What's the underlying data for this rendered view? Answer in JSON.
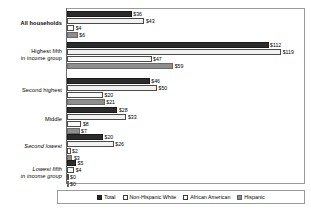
{
  "chart_data": {
    "type": "bar",
    "orientation": "horizontal",
    "title": "",
    "xlabel": "",
    "ylabel": "",
    "grid": false,
    "legend_position": "bottom",
    "xlim": [
      0,
      125
    ],
    "value_prefix": "$",
    "categories": [
      "All households",
      "Highest fifth in income group",
      "Second highest",
      "Middle",
      "Second lowest",
      "Lowest fifth in income group"
    ],
    "series": [
      {
        "name": "Total",
        "color": "#2b2b2b",
        "values": [
          36,
          112,
          46,
          28,
          20,
          5
        ]
      },
      {
        "name": "Non-Hispanic White",
        "color": "#f2f2f2",
        "values": [
          43,
          119,
          50,
          33,
          26,
          4
        ]
      },
      {
        "name": "African American",
        "color": "#fbfbfb",
        "values": [
          4,
          47,
          20,
          8,
          2,
          0
        ]
      },
      {
        "name": "Hispanic",
        "color": "#8e8e8e",
        "values": [
          6,
          59,
          21,
          7,
          3,
          0
        ]
      }
    ]
  },
  "axis": {
    "categories": [
      {
        "line1": "All households",
        "line2": "",
        "style": "bold"
      },
      {
        "line1": "Highest fifth",
        "line2": "in income group",
        "style": "normal"
      },
      {
        "line1": "Second highest",
        "line2": "",
        "style": "normal"
      },
      {
        "line1": "Middle",
        "line2": "",
        "style": "normal"
      },
      {
        "line1": "Second lowest",
        "line2": "",
        "style": "italic"
      },
      {
        "line1": "Lowest fifth",
        "line2": "in income group",
        "style": "italic"
      }
    ]
  },
  "legend": {
    "items": [
      {
        "label": "Total",
        "swatch": "s-total"
      },
      {
        "label": "Non-Hispanic White",
        "swatch": "s-nhw"
      },
      {
        "label": "African American",
        "swatch": "s-aa"
      },
      {
        "label": "Hispanic",
        "swatch": "s-hisp"
      }
    ]
  },
  "value_labels": {
    "group_0": [
      "$36",
      "$43",
      "$4",
      "$6"
    ],
    "group_1": [
      "$112",
      "$119",
      "$47",
      "$59"
    ],
    "group_2": [
      "$46",
      "$50",
      "$20",
      "$21"
    ],
    "group_3": [
      "$28",
      "$33",
      "$8",
      "$7"
    ],
    "group_4": [
      "$20",
      "$26",
      "$2",
      "$3"
    ],
    "group_5": [
      "$5",
      "$4",
      "$0",
      "$0"
    ]
  }
}
